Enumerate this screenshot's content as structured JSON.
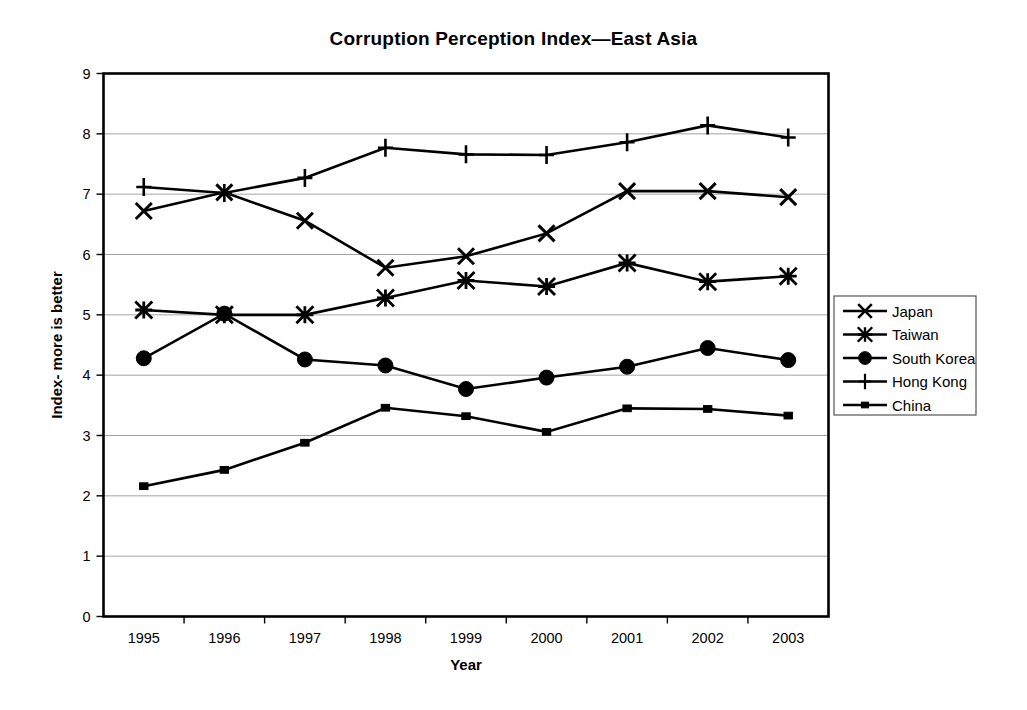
{
  "chart_data": {
    "type": "line",
    "title": "Corruption Perception Index—East Asia",
    "xlabel": "Year",
    "ylabel": "Index- more is better",
    "categories": [
      "1995",
      "1996",
      "1997",
      "1998",
      "1999",
      "2000",
      "2001",
      "2002",
      "2003"
    ],
    "x": [
      1995,
      1996,
      1997,
      1998,
      1999,
      2000,
      2001,
      2002,
      2003
    ],
    "ylim": [
      0,
      9
    ],
    "ytick_labels": [
      "0",
      "1",
      "2",
      "3",
      "4",
      "5",
      "6",
      "7",
      "8",
      "9"
    ],
    "ytick_values": [
      0,
      1,
      2,
      3,
      4,
      5,
      6,
      7,
      8,
      9
    ],
    "grid": true,
    "legend_position": "right",
    "series": [
      {
        "name": "Japan",
        "marker": "x-cross",
        "values": [
          6.72,
          7.03,
          6.56,
          5.78,
          5.97,
          6.35,
          7.05,
          7.05,
          6.95
        ]
      },
      {
        "name": "Taiwan",
        "marker": "asterisk",
        "values": [
          5.08,
          5.0,
          5.0,
          5.28,
          5.57,
          5.47,
          5.86,
          5.55,
          5.64
        ]
      },
      {
        "name": "South Korea",
        "marker": "filled-circle",
        "values": [
          4.28,
          5.02,
          4.26,
          4.16,
          3.77,
          3.96,
          4.14,
          4.45,
          4.25
        ]
      },
      {
        "name": "Hong Kong",
        "marker": "plus",
        "values": [
          7.12,
          7.02,
          7.27,
          7.77,
          7.66,
          7.65,
          7.86,
          8.14,
          7.94
        ]
      },
      {
        "name": "China",
        "marker": "small-square",
        "values": [
          2.16,
          2.43,
          2.88,
          3.46,
          3.32,
          3.06,
          3.45,
          3.44,
          3.33
        ]
      }
    ]
  },
  "legend": {
    "entries": [
      {
        "label": "Japan"
      },
      {
        "label": "Taiwan"
      },
      {
        "label": "South Korea"
      },
      {
        "label": "Hong Kong"
      },
      {
        "label": "China"
      }
    ]
  },
  "colors": {
    "series": "#000000",
    "grid": "#9a9a9a",
    "border": "#000000",
    "background": "#ffffff"
  }
}
